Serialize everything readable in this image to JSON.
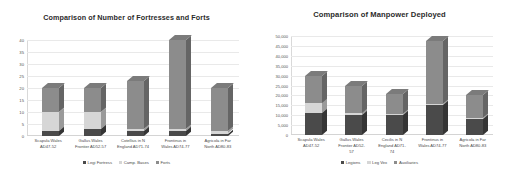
{
  "background_color": "#ffffff",
  "charts": [
    {
      "panel": "left",
      "chart_data": {
        "type": "bar",
        "stacked": true,
        "title": "Comparison of Number of Fortresses and Forts",
        "xlabel": "",
        "ylabel": "",
        "ylim": [
          0,
          40
        ],
        "yticks": [
          "0",
          "5",
          "10",
          "15",
          "20",
          "25",
          "30",
          "35",
          "40"
        ],
        "ytick_values": [
          0,
          5,
          10,
          15,
          20,
          25,
          30,
          35,
          40
        ],
        "grid": true,
        "legend_position": "bottom",
        "categories": [
          "Scapula Wales\nAD47-52",
          "Gallus Wales\nFrontier AD52-57",
          "Cotellius in N\nEngland AD71-74",
          "Frontinus in\nWales AD74-77",
          "Agricola in Far\nNorth AD80-83"
        ],
        "series": [
          {
            "name": "Legi Fortress",
            "color": "#4a4a4a",
            "values": [
              2,
              3,
              2,
              2,
              1
            ]
          },
          {
            "name": "Camp. Bases",
            "color": "#d6d6d6",
            "values": [
              8,
              7,
              1,
              1,
              1
            ]
          },
          {
            "name": "Forts",
            "color": "#8c8c8c",
            "values": [
              10,
              10,
              20,
              37,
              18
            ]
          }
        ],
        "totals": [
          20,
          20,
          23,
          40,
          20
        ]
      }
    },
    {
      "panel": "right",
      "chart_data": {
        "type": "bar",
        "stacked": true,
        "title": "Comparison of Manpower Deployed",
        "xlabel": "",
        "ylabel": "",
        "ylim": [
          0,
          50000
        ],
        "yticks": [
          "0",
          "5,000",
          "10,000",
          "15,000",
          "20,000",
          "25,000",
          "30,000",
          "35,000",
          "40,000",
          "45,000",
          "50,000"
        ],
        "ytick_values": [
          0,
          5000,
          10000,
          15000,
          20000,
          25000,
          30000,
          35000,
          40000,
          45000,
          50000
        ],
        "grid": true,
        "legend_position": "bottom",
        "categories": [
          "Scapula Wales\nAD47-52",
          "Gallus Wales\nFrontier AD52-\n57",
          "Cecilis in N\nEngland AD71-\n74",
          "Frontinus in\nWales AD74-77",
          "Agricola in Far\nNorth AD80-83"
        ],
        "series": [
          {
            "name": "Legions",
            "color": "#4a4a4a",
            "values": [
              11000,
              10000,
              10000,
              15000,
              8000
            ]
          },
          {
            "name": "Leg Vex",
            "color": "#d6d6d6",
            "values": [
              5000,
              1000,
              500,
              500,
              500
            ]
          },
          {
            "name": "Auxiliaries",
            "color": "#8c8c8c",
            "values": [
              14000,
              14000,
              10000,
              32000,
              11500
            ]
          }
        ],
        "totals": [
          30000,
          25000,
          20500,
          47500,
          20000
        ]
      }
    }
  ]
}
